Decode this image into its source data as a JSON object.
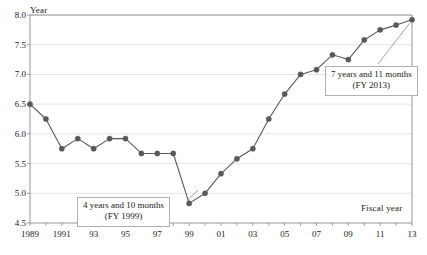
{
  "chart_data": {
    "type": "line",
    "title": "",
    "xlabel": "Fiscal year",
    "ylabel": "Year",
    "ylim": [
      4.5,
      8.0
    ],
    "ytick_labels": [
      "8.0",
      "7.5",
      "7.0",
      "6.5",
      "6.0",
      "5.5",
      "5.0",
      "4.5"
    ],
    "ytick_values": [
      8.0,
      7.5,
      7.0,
      6.5,
      6.0,
      5.5,
      5.0,
      4.5
    ],
    "grid": true,
    "legend": "none",
    "categories": [
      "1989",
      "1990",
      "1991",
      "1992",
      "1993",
      "1994",
      "1995",
      "1996",
      "1997",
      "1998",
      "1999",
      "2000",
      "2001",
      "2002",
      "2003",
      "2004",
      "2005",
      "2006",
      "2007",
      "2008",
      "2009",
      "2010",
      "2011",
      "2012",
      "2013"
    ],
    "xtick_labels": [
      "1989",
      "",
      "1991",
      "",
      "93",
      "",
      "95",
      "",
      "97",
      "",
      "99",
      "",
      "01",
      "",
      "03",
      "",
      "05",
      "",
      "07",
      "",
      "09",
      "",
      "11",
      "",
      "13"
    ],
    "values": [
      6.5,
      6.25,
      5.75,
      5.92,
      5.75,
      5.92,
      5.92,
      5.67,
      5.67,
      5.67,
      4.83,
      5.0,
      5.33,
      5.58,
      5.75,
      6.25,
      6.67,
      7.0,
      7.08,
      7.33,
      7.25,
      7.58,
      7.75,
      7.83,
      7.92
    ],
    "series_color": "#595959",
    "gridline_color": "#dddddd",
    "axis_color": "#8a8a8a",
    "annotations": [
      {
        "id": "low",
        "line1": "4 years and 10 months",
        "line2": "(FY 1999)",
        "target_category": "1999",
        "target_value": 4.83
      },
      {
        "id": "high",
        "line1": "7 years and 11 months",
        "line2": "(FY 2013)",
        "target_category": "2013",
        "target_value": 7.92
      }
    ]
  }
}
